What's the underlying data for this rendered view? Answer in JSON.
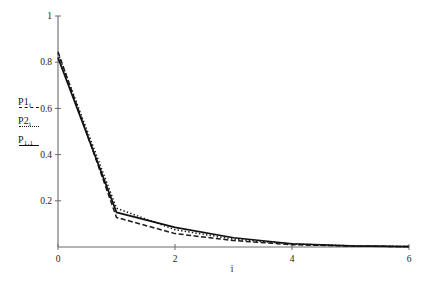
{
  "chart_data": {
    "type": "line",
    "title": "",
    "xlabel": "i",
    "ylabel": "",
    "xlim": [
      0,
      6
    ],
    "ylim": [
      0,
      1
    ],
    "grid": false,
    "legend_position": "outside-left",
    "xticks": [
      "0",
      "2",
      "4",
      "6"
    ],
    "xtick_values": [
      0,
      2,
      4,
      6
    ],
    "yticks": [
      "0.2",
      "0.4",
      "0.6",
      "0.8",
      "1"
    ],
    "ytick_values": [
      0.2,
      0.4,
      0.6,
      0.8,
      1
    ],
    "x": [
      0,
      1,
      2,
      3,
      4,
      5,
      6
    ],
    "series": [
      {
        "name": "P1",
        "label": "P1",
        "label_sub": "i",
        "style": "dashed",
        "color": "#1a1a1a",
        "values": [
          0.845,
          0.128,
          0.058,
          0.028,
          0.01,
          0.004,
          0.002
        ]
      },
      {
        "name": "P2",
        "label": "P2",
        "label_sub": "i",
        "style": "dotted",
        "color": "#1a1a1a",
        "values": [
          0.838,
          0.168,
          0.075,
          0.034,
          0.013,
          0.005,
          0.002
        ]
      },
      {
        "name": "P11",
        "label": "P",
        "label_sub": "1,1",
        "style": "solid",
        "color": "#111111",
        "values": [
          0.82,
          0.15,
          0.085,
          0.04,
          0.014,
          0.005,
          0.002
        ]
      }
    ]
  },
  "axes": {
    "x_axis_label": "i",
    "x_tick_labels": [
      "0",
      "2",
      "4",
      "6"
    ],
    "y_tick_labels": [
      "0.2",
      "0.4",
      "0.6",
      "0.8",
      "1"
    ]
  },
  "legend": {
    "entries": [
      {
        "label": "P1",
        "sub": "i",
        "style": "dashed"
      },
      {
        "label": "P2",
        "sub": "i",
        "style": "dotted"
      },
      {
        "label": "P",
        "sub": "1,1",
        "style": "solid"
      }
    ]
  },
  "colors": {
    "axis": "#6b6b6b",
    "ink": "#161616",
    "background": "#ffffff"
  }
}
